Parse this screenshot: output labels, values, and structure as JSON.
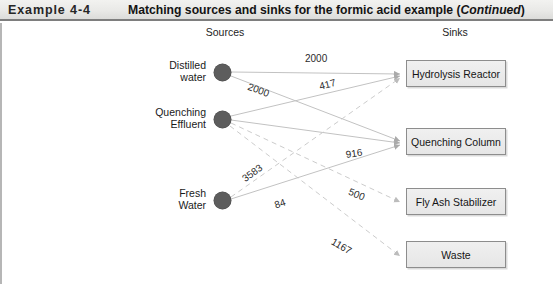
{
  "header": {
    "example_number": "Example 4-4",
    "title_main": "Matching sources and sinks for the formic acid example (",
    "title_continued": "Continued",
    "title_close": ")"
  },
  "diagram": {
    "headings": {
      "sources": "Sources",
      "sinks": "Sinks"
    },
    "sources": [
      {
        "id": "distilled-water",
        "label": "Distilled\nwater"
      },
      {
        "id": "quenching-effluent",
        "label": "Quenching\nEffluent"
      },
      {
        "id": "fresh-water",
        "label": "Fresh\nWater"
      }
    ],
    "sinks": [
      {
        "id": "hydrolysis-reactor",
        "label": "Hydrolysis Reactor"
      },
      {
        "id": "quenching-column",
        "label": "Quenching Column"
      },
      {
        "id": "fly-ash-stabilizer",
        "label": "Fly Ash Stabilizer"
      },
      {
        "id": "waste",
        "label": "Waste"
      }
    ],
    "flows": [
      {
        "id": "dw-hr",
        "from": "distilled-water",
        "to": "hydrolysis-reactor",
        "value": "2000"
      },
      {
        "id": "dw-qc",
        "from": "distilled-water",
        "to": "quenching-column",
        "value": "2000"
      },
      {
        "id": "qe-hr",
        "from": "quenching-effluent",
        "to": "hydrolysis-reactor",
        "value": "417"
      },
      {
        "id": "qe-qc",
        "from": "quenching-effluent",
        "to": "quenching-column",
        "value": "916"
      },
      {
        "id": "qe-fas",
        "from": "quenching-effluent",
        "to": "fly-ash-stabilizer",
        "value": "500"
      },
      {
        "id": "qe-waste",
        "from": "quenching-effluent",
        "to": "waste",
        "value": "1167"
      },
      {
        "id": "fw-hr",
        "from": "fresh-water",
        "to": "hydrolysis-reactor",
        "value": "3583"
      },
      {
        "id": "fw-qc",
        "from": "fresh-water",
        "to": "quenching-column",
        "value": "84"
      }
    ]
  },
  "colors": {
    "node_fill": "#5d5d5d",
    "box_border": "#8d8d8d",
    "header_rule": "#7e7e7e",
    "edge_solid": "#b9b9b9",
    "edge_dashed": "#c9c9c9"
  }
}
